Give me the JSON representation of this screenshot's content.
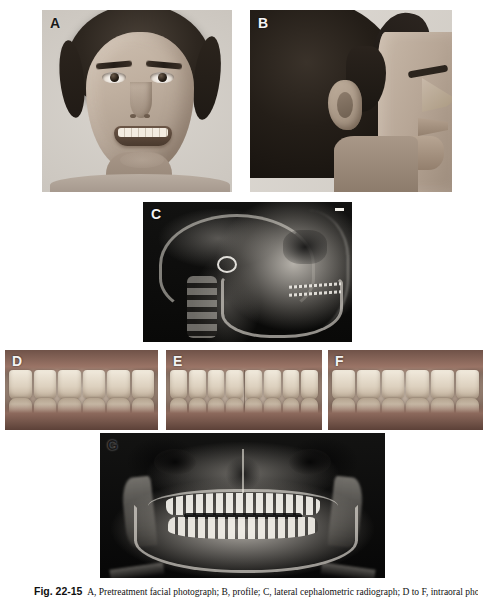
{
  "figure": {
    "number": "Fig. 22-15",
    "caption_body": "A, Pretreatment facial photograph; B, profile; C, lateral cephalometric radiograph; D to F, intraoral photographs; G, panoramic radiograph.",
    "panel_labels": [
      "A",
      "B",
      "C",
      "D",
      "E",
      "F",
      "G"
    ]
  },
  "panels": [
    {
      "id": "a",
      "label": "A",
      "label_color": "#1a1a1a",
      "name": "frontal-smiling-photograph",
      "type": "photograph",
      "view": "frontal smiling facial photograph of male patient"
    },
    {
      "id": "b",
      "label": "B",
      "label_color": "#f4f4f4",
      "name": "lateral-profile-photograph",
      "type": "photograph",
      "view": "right lateral facial profile photograph"
    },
    {
      "id": "c",
      "label": "C",
      "label_color": "#f4f4f4",
      "name": "lateral-cephalometric-radiograph",
      "type": "radiograph",
      "view": "lateral cephalometric radiograph"
    },
    {
      "id": "d",
      "label": "D",
      "label_color": "#f4f4f4",
      "name": "intraoral-right-lateral",
      "type": "intraoral-photograph",
      "view": "right buccal intraoral view",
      "upper_teeth": 6,
      "lower_teeth": 6
    },
    {
      "id": "e",
      "label": "E",
      "label_color": "#f4f4f4",
      "name": "intraoral-frontal",
      "type": "intraoral-photograph",
      "view": "frontal intraoral view in occlusion",
      "upper_teeth": 8,
      "lower_teeth": 8
    },
    {
      "id": "f",
      "label": "F",
      "label_color": "#f4f4f4",
      "name": "intraoral-left-lateral",
      "type": "intraoral-photograph",
      "view": "left buccal intraoral view",
      "upper_teeth": 6,
      "lower_teeth": 6
    },
    {
      "id": "g",
      "label": "G",
      "label_color": "#1a1a1a",
      "name": "panoramic-radiograph",
      "type": "radiograph",
      "view": "panoramic radiograph (orthopantomogram)"
    }
  ],
  "colors": {
    "page_background": "#ffffff",
    "radiograph_background": "#0a0a0a",
    "caption_text": "#101010",
    "label_dark": "#1a1a1a",
    "label_light": "#f4f4f4"
  }
}
